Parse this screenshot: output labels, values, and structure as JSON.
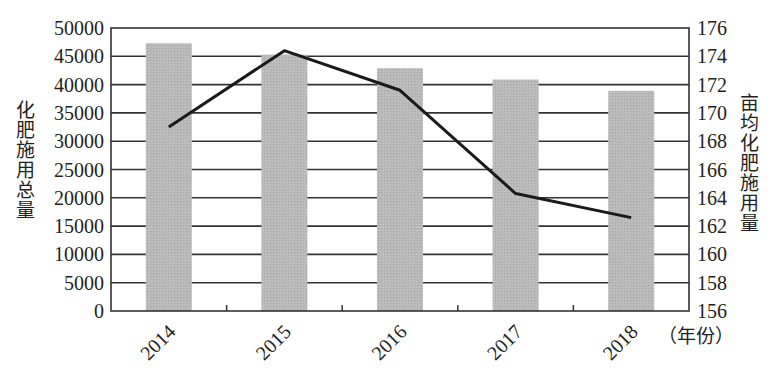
{
  "chart_data": {
    "type": "bar+line",
    "title": "",
    "categories": [
      "2014",
      "2015",
      "2016",
      "2017",
      "2018"
    ],
    "xlabel": "（年份）",
    "series": [
      {
        "name": "化肥施用总量",
        "type": "bar",
        "axis": "left",
        "values": [
          47300,
          45300,
          42900,
          40900,
          38900
        ]
      },
      {
        "name": "亩均化肥施用量",
        "type": "line",
        "axis": "right",
        "values": [
          169.0,
          174.4,
          171.6,
          164.3,
          162.6
        ]
      }
    ],
    "ylabel_left": "化肥施用总量",
    "ylabel_right": "亩均化肥施用量",
    "ylim_left": [
      0,
      50000
    ],
    "ylim_right": [
      156,
      176
    ],
    "yticks_left": [
      "0",
      "5000",
      "10000",
      "15000",
      "20000",
      "25000",
      "30000",
      "35000",
      "40000",
      "45000",
      "50000"
    ],
    "yticks_right": [
      "156",
      "158",
      "160",
      "162",
      "164",
      "166",
      "168",
      "170",
      "172",
      "174",
      "176"
    ],
    "grid": true,
    "legend": "none",
    "colors": {
      "bar": "#b5b5b5",
      "line": "#1a1a1a",
      "grid": "#333333",
      "text": "#231f20"
    }
  }
}
